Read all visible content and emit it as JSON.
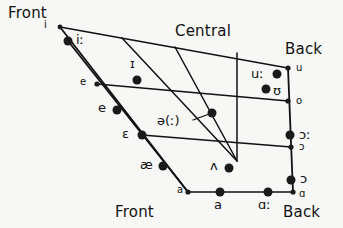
{
  "chart_data": {
    "type": "scatter",
    "title": "",
    "xlabel": "",
    "ylabel": "",
    "axis_ranges": {
      "x": [
        0,
        343
      ],
      "y": [
        0,
        228
      ]
    },
    "grid": false,
    "legend": false,
    "region_labels": [
      {
        "text": "Front",
        "x": 8,
        "y": 6
      },
      {
        "text": "Central",
        "x": 175,
        "y": 24
      },
      {
        "text": "Back",
        "x": 285,
        "y": 42
      },
      {
        "text": "Front",
        "x": 115,
        "y": 205
      },
      {
        "text": "Back",
        "x": 283,
        "y": 205
      }
    ],
    "quad_outline": [
      {
        "x": 60,
        "y": 27
      },
      {
        "x": 288,
        "y": 68
      },
      {
        "x": 293,
        "y": 192
      },
      {
        "x": 188,
        "y": 192
      }
    ],
    "height_lines": [
      {
        "x1": 60,
        "y1": 27,
        "x2": 288,
        "y2": 68,
        "name": "close-line"
      },
      {
        "x1": 97,
        "y1": 84,
        "x2": 288,
        "y2": 101,
        "name": "close-mid-line"
      },
      {
        "x1": 142,
        "y1": 135,
        "x2": 291,
        "y2": 147,
        "name": "open-mid-line"
      },
      {
        "x1": 188,
        "y1": 192,
        "x2": 293,
        "y2": 192,
        "name": "open-line"
      }
    ],
    "front_edges": [
      {
        "x1": 60,
        "y1": 27,
        "x2": 188,
        "y2": 192,
        "name": "front-edge-outer"
      },
      {
        "x1": 68,
        "y1": 41,
        "x2": 188,
        "y2": 192,
        "name": "front-edge-inner"
      }
    ],
    "back_edges": [
      {
        "x1": 288,
        "y1": 68,
        "x2": 293,
        "y2": 192,
        "name": "back-edge"
      }
    ],
    "converging_lines": [
      {
        "x1": 122,
        "y1": 38,
        "x2": 237,
        "y2": 161,
        "name": "central-line-1"
      },
      {
        "x1": 175,
        "y1": 47,
        "x2": 237,
        "y2": 161,
        "name": "central-line-2"
      },
      {
        "x1": 237,
        "y1": 53,
        "x2": 237,
        "y2": 161,
        "name": "central-line-3"
      }
    ],
    "leader_line": {
      "x1": 193,
      "y1": 120,
      "x2": 212,
      "y2": 113,
      "name": "schwa-leader"
    },
    "points": [
      {
        "symbol": "i",
        "x": 60,
        "y": 27,
        "r": 2.4,
        "label_x": 44,
        "label_y": 20,
        "size": "sm",
        "name": "vowel-i-short"
      },
      {
        "symbol": "iː",
        "x": 68,
        "y": 41,
        "r": 4.5,
        "label_x": 76,
        "label_y": 33,
        "size": "md",
        "name": "vowel-i-long"
      },
      {
        "symbol": "ɪ",
        "x": 137,
        "y": 80,
        "r": 4.5,
        "label_x": 130,
        "label_y": 57,
        "size": "md",
        "name": "vowel-small-capital-i"
      },
      {
        "symbol": "e",
        "x": 97,
        "y": 84,
        "r": 2.6,
        "label_x": 80,
        "label_y": 77,
        "size": "sm",
        "name": "vowel-e-close-mid"
      },
      {
        "symbol": "e",
        "x": 117,
        "y": 110,
        "r": 4.5,
        "label_x": 98,
        "label_y": 101,
        "size": "md",
        "name": "vowel-e-lower"
      },
      {
        "symbol": "ɛ",
        "x": 142,
        "y": 135,
        "r": 4.5,
        "label_x": 122,
        "label_y": 127,
        "size": "md",
        "name": "vowel-epsilon"
      },
      {
        "symbol": "æ",
        "x": 163,
        "y": 166,
        "r": 4.5,
        "label_x": 140,
        "label_y": 158,
        "size": "md",
        "name": "vowel-ae"
      },
      {
        "symbol": "a",
        "x": 188,
        "y": 192,
        "r": 2.6,
        "label_x": 177,
        "label_y": 185,
        "size": "sm",
        "name": "vowel-a-front-corner"
      },
      {
        "symbol": "a",
        "x": 220,
        "y": 192,
        "r": 4.5,
        "label_x": 214,
        "label_y": 198,
        "size": "md",
        "name": "vowel-a-open"
      },
      {
        "symbol": "ɑː",
        "x": 268,
        "y": 192,
        "r": 4.5,
        "label_x": 258,
        "label_y": 198,
        "size": "md",
        "name": "vowel-script-a-long"
      },
      {
        "symbol": "ɑ",
        "x": 293,
        "y": 192,
        "r": 2.6,
        "label_x": 299,
        "label_y": 189,
        "size": "sm",
        "name": "vowel-script-a-back-corner"
      },
      {
        "symbol": "ɔ",
        "x": 291,
        "y": 180,
        "r": 4.5,
        "label_x": 300,
        "label_y": 172,
        "size": "md",
        "name": "vowel-open-o-lower"
      },
      {
        "symbol": "ɔ",
        "x": 291,
        "y": 147,
        "r": 2.6,
        "label_x": 299,
        "label_y": 142,
        "size": "sm",
        "name": "vowel-open-o-small"
      },
      {
        "symbol": "ɔː",
        "x": 290,
        "y": 135,
        "r": 4.5,
        "label_x": 299,
        "label_y": 128,
        "size": "md",
        "name": "vowel-open-o-long"
      },
      {
        "symbol": "o",
        "x": 288,
        "y": 101,
        "r": 2.6,
        "label_x": 296,
        "label_y": 96,
        "size": "sm",
        "name": "vowel-o"
      },
      {
        "symbol": "u",
        "x": 288,
        "y": 68,
        "r": 2.6,
        "label_x": 296,
        "label_y": 63,
        "size": "sm",
        "name": "vowel-u-back-corner"
      },
      {
        "symbol": "uː",
        "x": 277,
        "y": 74,
        "r": 4.5,
        "label_x": 251,
        "label_y": 67,
        "size": "md",
        "name": "vowel-u-long"
      },
      {
        "symbol": "ʊ",
        "x": 266,
        "y": 89,
        "r": 4.5,
        "label_x": 273,
        "label_y": 84,
        "size": "md",
        "name": "vowel-upsilon"
      },
      {
        "symbol": "ə(ː)",
        "x": 212,
        "y": 113,
        "r": 4.5,
        "label_x": 157,
        "label_y": 114,
        "size": "md",
        "name": "vowel-schwa"
      },
      {
        "symbol": "ʌ",
        "x": 229,
        "y": 168,
        "r": 4.5,
        "label_x": 210,
        "label_y": 159,
        "size": "md",
        "name": "vowel-turned-v"
      }
    ],
    "colors": {
      "line": "#111111",
      "dot": "#1a1a1a",
      "text": "#111111",
      "background": "#f7f7f5"
    }
  }
}
